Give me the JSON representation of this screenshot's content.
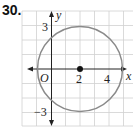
{
  "problem_number": "30.",
  "graph": {
    "x_axis_label": "x",
    "y_axis_label": "y",
    "origin_label": "O",
    "x_tick_labels": [
      "2",
      "4"
    ],
    "y_tick_labels": [
      "3",
      "−3"
    ],
    "grid_unit_px": 14.4,
    "origin_px": [
      51,
      69
    ],
    "circle": {
      "center": [
        2,
        0
      ],
      "radius": 3,
      "stroke": "#8a8a8a"
    },
    "center_point": [
      2,
      0
    ],
    "grid_color": "#cfcfcf",
    "axis_color": "#222222"
  }
}
